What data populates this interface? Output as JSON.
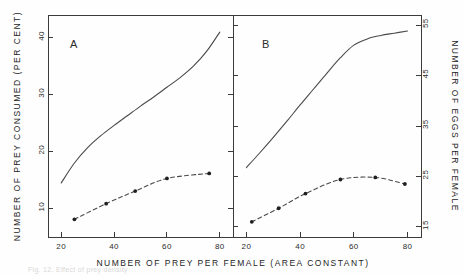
{
  "figure": {
    "caption_fragment": "Fig. 12. Effect of prey density",
    "background_color": "#fefefe",
    "ink_color": "#3b3b3b"
  },
  "axes": {
    "x_title": "NUMBER OF PREY PER FEMALE (AREA CONSTANT)",
    "y_left_title": "NUMBER OF PREY CONSUMED (PER CENT)",
    "y_right_title": "NUMBER OF EGGS PER FEMALE",
    "x_ticks": [
      "20",
      "40",
      "60",
      "80"
    ],
    "y_left_ticks": [
      "10",
      "20",
      "30",
      "40"
    ],
    "y_right_ticks": [
      "15",
      "25",
      "35",
      "45",
      "55"
    ]
  },
  "chart_data": {
    "type": "line",
    "title": "",
    "xlabel": "NUMBER OF PREY PER FEMALE (AREA CONSTANT)",
    "ylabel": "NUMBER OF PREY CONSUMED (PER CENT)",
    "ylabel_right": "NUMBER OF EGGS PER FEMALE",
    "xlim": [
      15,
      85
    ],
    "ylim_left": [
      5,
      44
    ],
    "ylim_right": [
      13,
      57
    ],
    "grid": false,
    "legend": "none",
    "panels": [
      {
        "id": "A",
        "label": "A",
        "xlim": [
          15,
          85
        ],
        "ylim_left": [
          5,
          44
        ],
        "ylim_right": [
          13,
          57
        ],
        "x_ticks": [
          20,
          40,
          60,
          80
        ],
        "y_left_ticks": [
          10,
          20,
          30,
          40
        ],
        "series": [
          {
            "name": "prey consumed (per cent)",
            "style": "solid",
            "axis": "left",
            "markers": false,
            "x": [
              20,
              25,
              30,
              35,
              40,
              45,
              50,
              55,
              60,
              65,
              70,
              75,
              80
            ],
            "values": [
              14.5,
              18.0,
              20.7,
              22.8,
              24.6,
              26.3,
              28.0,
              29.6,
              31.3,
              33.0,
              35.0,
              37.6,
              41.0
            ]
          },
          {
            "name": "eggs per female",
            "style": "dashed",
            "axis": "right",
            "markers": true,
            "x": [
              25,
              37,
              48,
              60,
              76
            ],
            "values": [
              16.5,
              19.6,
              22.1,
              24.6,
              25.6
            ]
          }
        ]
      },
      {
        "id": "B",
        "label": "B",
        "xlim": [
          15,
          85
        ],
        "ylim_left": [
          5,
          44
        ],
        "ylim_right": [
          13,
          57
        ],
        "x_ticks": [
          20,
          40,
          60,
          80
        ],
        "y_right_ticks": [
          15,
          25,
          35,
          45,
          55
        ],
        "series": [
          {
            "name": "prey consumed (per cent)",
            "style": "solid",
            "axis": "left",
            "markers": false,
            "x": [
              20,
              25,
              30,
              35,
              40,
              45,
              50,
              55,
              60,
              65,
              70,
              75,
              80
            ],
            "values": [
              17.2,
              19.8,
              22.5,
              25.3,
              28.2,
              31.0,
              33.8,
              36.5,
              38.7,
              39.8,
              40.4,
              40.8,
              41.2
            ]
          },
          {
            "name": "eggs per female",
            "style": "dashed",
            "axis": "right",
            "markers": true,
            "x": [
              22,
              32,
              42,
              55,
              68,
              79
            ],
            "values": [
              16.0,
              18.7,
              21.6,
              24.4,
              24.8,
              23.5
            ]
          }
        ]
      }
    ]
  }
}
